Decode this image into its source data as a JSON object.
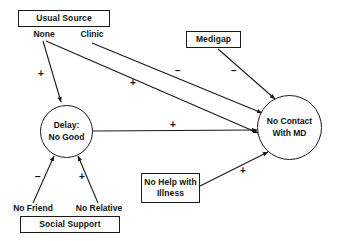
{
  "diagram": {
    "nodes": {
      "usual_source": "Usual Source",
      "usual_source_none": "None",
      "usual_source_clinic": "Clinic",
      "medigap": "Medigap",
      "delay": "Delay:\nNo Good",
      "no_contact": "No Contact\nWith MD",
      "no_help": "No Help with\nIllness",
      "social_support": "Social Support",
      "no_friend": "No Friend",
      "no_relative": "No Relative"
    },
    "edges": [
      {
        "id": "none-to-delay",
        "from": "None",
        "to": "Delay: No Good",
        "sign": "+"
      },
      {
        "id": "none-to-nocontact",
        "from": "None",
        "to": "No Contact With MD",
        "sign": "+"
      },
      {
        "id": "clinic-to-nocontact",
        "from": "Clinic",
        "to": "No Contact With MD",
        "sign": "−"
      },
      {
        "id": "medigap-to-nocontact",
        "from": "Medigap",
        "to": "No Contact With MD",
        "sign": "−"
      },
      {
        "id": "delay-to-nocontact",
        "from": "Delay: No Good",
        "to": "No Contact With MD",
        "sign": "+"
      },
      {
        "id": "nofriend-to-delay",
        "from": "No Friend",
        "to": "Delay: No Good",
        "sign": "−"
      },
      {
        "id": "norelative-to-delay",
        "from": "No Relative",
        "to": "Delay: No Good",
        "sign": "+"
      },
      {
        "id": "nohelp-to-nocontact",
        "from": "No Help with Illness",
        "to": "No Contact With MD",
        "sign": "+"
      }
    ],
    "signs": {
      "none_delay": "+",
      "none_nocontact": "+",
      "clinic_nocontact": "−",
      "medigap_nocontact": "−",
      "delay_nocontact": "+",
      "nofriend_delay": "−",
      "norelative_delay": "+",
      "nohelp_nocontact": "+"
    },
    "colors": {
      "stroke": "#1a1a1a",
      "text": "#111111",
      "background": "#ffffff"
    }
  }
}
